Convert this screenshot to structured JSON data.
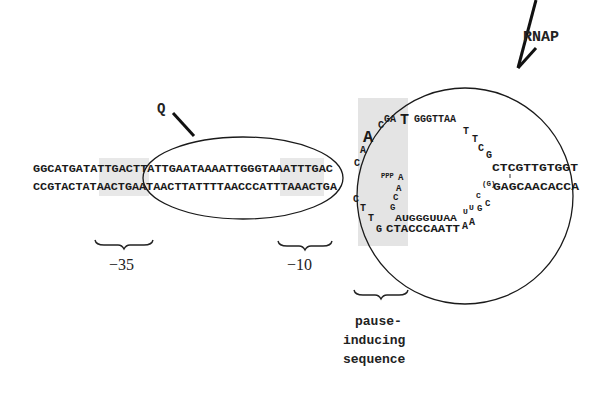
{
  "labels": {
    "rnap": "RNAP",
    "q": "Q",
    "minus35": "−35",
    "minus10": "−10",
    "pause_line1": "pause-",
    "pause_line2": "inducing",
    "pause_line3": "sequence"
  },
  "dna": {
    "top_strand": "GGCATGATATTGACTTATTGAATAAAATTGGGTAAATTTGAC",
    "bottom_strand": "CCGTACTATAACTGAATAACTTATTTTAACCCATTTAAACTGA"
  },
  "bubble": {
    "nontemplate_upper": [
      "C",
      "A",
      "A",
      "C",
      "GA",
      "T",
      "GGGTTAA",
      "T",
      "T",
      "C",
      "G",
      "CTCGTTGTGGT"
    ],
    "template_lower": [
      "C",
      "T",
      "T",
      "G",
      "CTACCCAATT",
      "A",
      "A"
    ],
    "downstream_bottom": "GAGCAACACCA",
    "g_bracket": "(G)",
    "rna": {
      "triphosphate": "PPP",
      "bases": [
        "A",
        "A",
        "C",
        "G"
      ],
      "strand": "AUGGGUUAA",
      "hairpin": [
        "U",
        "U",
        "C",
        "G",
        "C"
      ]
    }
  },
  "colors": {
    "shade": "#e6e6e6",
    "stroke": "#1a1a1a"
  }
}
